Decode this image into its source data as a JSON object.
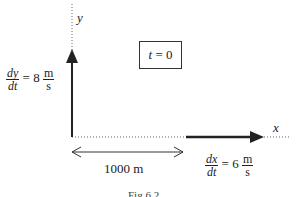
{
  "axes": {
    "x_label": "x",
    "y_label": "y"
  },
  "time_box": {
    "var": "t",
    "text": "= 0"
  },
  "y_rate": {
    "num": "dy",
    "den": "dt",
    "eq": "= 8",
    "unit_num": "m",
    "unit_den": "s"
  },
  "x_rate": {
    "num": "dx",
    "den": "dt",
    "eq": "= 6",
    "unit_num": "m",
    "unit_den": "s"
  },
  "distance": {
    "label": "1000 m"
  },
  "caption": {
    "text": "Fig 6.2"
  },
  "colors": {
    "line": "#222222",
    "dotted": "#666666"
  }
}
